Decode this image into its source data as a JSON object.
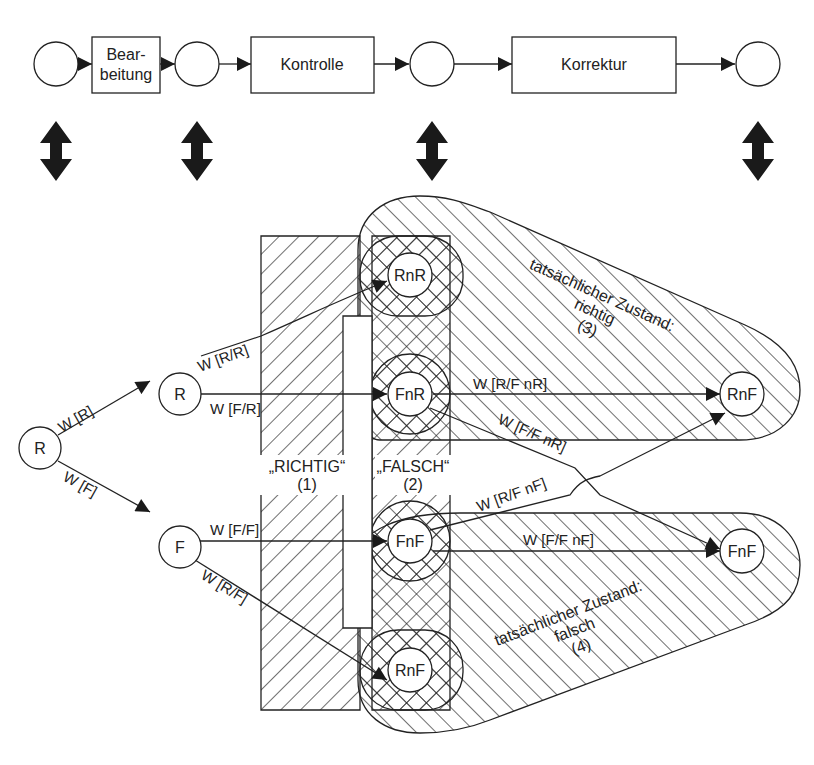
{
  "colors": {
    "stroke": "#222222",
    "fill_arrow": "#1a1a1a",
    "background": "#ffffff"
  },
  "process": {
    "steps": [
      {
        "type": "event"
      },
      {
        "type": "activity",
        "label_line1": "Bear-",
        "label_line2": "beitung"
      },
      {
        "type": "event"
      },
      {
        "type": "activity",
        "label": "Kontrolle"
      },
      {
        "type": "event"
      },
      {
        "type": "activity",
        "label": "Korrektur"
      },
      {
        "type": "event"
      }
    ]
  },
  "mapping_arrows": {
    "count": 4,
    "icon": "double-arrow-vertical-icon"
  },
  "tree": {
    "nodes": {
      "root": "R",
      "r1": "R",
      "f1": "F",
      "rnr": "RnR",
      "fnr": "FnR",
      "fnf": "FnF",
      "rnf_bottom": "RnF",
      "rnf_right": "RnF",
      "fnf_right": "FnF"
    },
    "edges": {
      "w_r": "W [R]",
      "w_f": "W [F]",
      "w_rr": "W [R/R]",
      "w_fr": "W [F/R]",
      "w_ff": "W [F/F]",
      "w_rf": "W [R/F]",
      "w_rf_nr": "W [R/F nR]",
      "w_ff_nr": "W [F/F nR]",
      "w_rf_nf": "W [R/F nF]",
      "w_ff_nf": "W [F/F nF]"
    }
  },
  "areas": {
    "richtig": {
      "label": "„RICHTIG“",
      "num": "(1)"
    },
    "falsch": {
      "label": "„FALSCH“",
      "num": "(2)"
    },
    "actual_right": {
      "line1": "tatsächlicher Zustand:",
      "line2": "richtig",
      "num": "(3)"
    },
    "actual_wrong": {
      "line1": "tatsächlicher Zustand:",
      "line2": "falsch",
      "num": "(4)"
    }
  }
}
